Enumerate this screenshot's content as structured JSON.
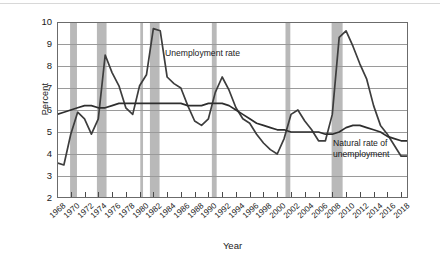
{
  "chart_data": {
    "type": "line",
    "title": "",
    "xlabel": "Year",
    "ylabel": "Percent",
    "xlim": [
      1968,
      2019
    ],
    "ylim": [
      2,
      10
    ],
    "yticks": [
      2,
      3,
      4,
      5,
      6,
      7,
      8,
      9,
      10
    ],
    "xticks": [
      1968,
      1970,
      1972,
      1974,
      1976,
      1978,
      1980,
      1982,
      1984,
      1986,
      1988,
      1990,
      1992,
      1994,
      1996,
      1998,
      2000,
      2002,
      2004,
      2006,
      2008,
      2010,
      2012,
      2014,
      2016,
      2018
    ],
    "grid": "horizontal",
    "legend_position": "inline-annotations",
    "x": [
      1968,
      1969,
      1970,
      1971,
      1972,
      1973,
      1974,
      1975,
      1976,
      1977,
      1978,
      1979,
      1980,
      1981,
      1982,
      1983,
      1984,
      1985,
      1986,
      1987,
      1988,
      1989,
      1990,
      1991,
      1992,
      1993,
      1994,
      1995,
      1996,
      1997,
      1998,
      1999,
      2000,
      2001,
      2002,
      2003,
      2004,
      2005,
      2006,
      2007,
      2008,
      2009,
      2010,
      2011,
      2012,
      2013,
      2014,
      2015,
      2016,
      2017,
      2018,
      2019
    ],
    "series": [
      {
        "name": "Unemployment rate",
        "color": "#3d3d3d",
        "values": [
          3.6,
          3.5,
          4.9,
          5.9,
          5.6,
          4.9,
          5.6,
          8.5,
          7.7,
          7.1,
          6.1,
          5.8,
          7.1,
          7.6,
          9.7,
          9.6,
          7.5,
          7.2,
          7.0,
          6.2,
          5.5,
          5.3,
          5.6,
          6.8,
          7.5,
          6.9,
          6.1,
          5.6,
          5.4,
          4.9,
          4.5,
          4.2,
          4.0,
          4.7,
          5.8,
          6.0,
          5.5,
          5.1,
          4.6,
          4.6,
          5.8,
          9.3,
          9.6,
          8.9,
          8.1,
          7.4,
          6.2,
          5.3,
          4.9,
          4.4,
          3.9,
          3.9
        ]
      },
      {
        "name": "Natural rate of unemployment",
        "color": "#2e2e2e",
        "values": [
          5.8,
          5.9,
          6.0,
          6.1,
          6.2,
          6.2,
          6.1,
          6.1,
          6.2,
          6.3,
          6.3,
          6.3,
          6.3,
          6.3,
          6.3,
          6.3,
          6.3,
          6.3,
          6.3,
          6.2,
          6.2,
          6.2,
          6.3,
          6.3,
          6.3,
          6.2,
          6.0,
          5.8,
          5.6,
          5.4,
          5.3,
          5.2,
          5.1,
          5.1,
          5.0,
          5.0,
          5.0,
          5.0,
          5.0,
          4.9,
          4.9,
          5.0,
          5.2,
          5.3,
          5.3,
          5.2,
          5.1,
          5.0,
          4.8,
          4.7,
          4.6,
          4.6
        ]
      }
    ],
    "recession_bands": [
      {
        "label": "1969-1970 recession",
        "start": 1969.9,
        "end": 1970.9
      },
      {
        "label": "1973-1975 recession",
        "start": 1973.8,
        "end": 1975.2
      },
      {
        "label": "1980 recession",
        "start": 1980.1,
        "end": 1980.5
      },
      {
        "label": "1981-1982 recession",
        "start": 1981.5,
        "end": 1982.9
      },
      {
        "label": "1990-1991 recession",
        "start": 1990.5,
        "end": 1991.2
      },
      {
        "label": "2001 recession",
        "start": 2001.2,
        "end": 2001.9
      },
      {
        "label": "2007-2009 recession",
        "start": 2007.9,
        "end": 2009.5
      }
    ],
    "band_color": "#b9b9b9",
    "grid_color": "#9a9a9a",
    "axis_color": "#555555",
    "annotations": [
      {
        "name": "unemployment-rate-label",
        "text": "Unemployment rate"
      },
      {
        "name": "natural-rate-label-line1",
        "text": "Natural rate of"
      },
      {
        "name": "natural-rate-label-line2",
        "text": "unemployment"
      }
    ]
  }
}
